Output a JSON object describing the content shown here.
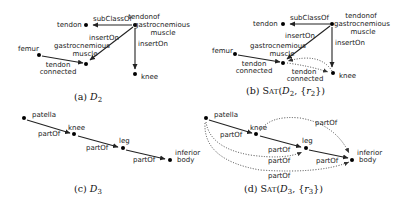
{
  "panels": [
    {
      "id": "a",
      "caption": "(a) D₂",
      "nodes": [
        {
          "id": "tendon",
          "label": "tendon"
        },
        {
          "id": "tog",
          "label": "tendonof gastrocnemious muscle"
        },
        {
          "id": "gm",
          "label": "gastrocnemious muscle"
        },
        {
          "id": "femur",
          "label": "femur"
        },
        {
          "id": "knee",
          "label": "knee"
        }
      ],
      "edges": [
        {
          "from": "tog",
          "to": "tendon",
          "label": "subClassOf",
          "style": "solid"
        },
        {
          "from": "tog",
          "to": "gm",
          "label": "insertOn",
          "style": "solid"
        },
        {
          "from": "tog",
          "to": "knee",
          "label": "insertOn",
          "style": "solid"
        },
        {
          "from": "femur",
          "to": "gm",
          "label": "tendon connected",
          "style": "solid"
        }
      ]
    },
    {
      "id": "b",
      "caption": "(b) SAT(D₂, {r₂})",
      "nodes": [
        {
          "id": "tendon",
          "label": "tendon"
        },
        {
          "id": "tog",
          "label": "tendonof gastrocnemious muscle"
        },
        {
          "id": "gm",
          "label": "gastrocnemious muscle"
        },
        {
          "id": "femur",
          "label": "femur"
        },
        {
          "id": "knee",
          "label": "knee"
        }
      ],
      "edges": [
        {
          "from": "tog",
          "to": "tendon",
          "label": "subClassOf",
          "style": "solid"
        },
        {
          "from": "tog",
          "to": "gm",
          "label": "insertOn",
          "style": "solid"
        },
        {
          "from": "tog",
          "to": "knee",
          "label": "insertOn",
          "style": "solid"
        },
        {
          "from": "femur",
          "to": "gm",
          "label": "tendon connected",
          "style": "solid"
        },
        {
          "from": "gm",
          "to": "knee",
          "label": "tendon connected",
          "style": "dotted"
        },
        {
          "from": "knee",
          "to": "gm",
          "label": "",
          "style": "dotted"
        }
      ]
    },
    {
      "id": "c",
      "caption": "(c) D₃",
      "nodes": [
        {
          "id": "patella",
          "label": "patella"
        },
        {
          "id": "knee",
          "label": "knee"
        },
        {
          "id": "leg",
          "label": "leg"
        },
        {
          "id": "ib",
          "label": "inferior body"
        }
      ],
      "edges": [
        {
          "from": "patella",
          "to": "knee",
          "label": "partOf",
          "style": "solid"
        },
        {
          "from": "knee",
          "to": "leg",
          "label": "partOf",
          "style": "solid"
        },
        {
          "from": "leg",
          "to": "ib",
          "label": "partOf",
          "style": "solid"
        }
      ]
    },
    {
      "id": "d",
      "caption": "(d) SAT(D₃, {r₃})",
      "nodes": [
        {
          "id": "patella",
          "label": "patella"
        },
        {
          "id": "knee",
          "label": "knee"
        },
        {
          "id": "leg",
          "label": "leg"
        },
        {
          "id": "ib",
          "label": "inferior body"
        }
      ],
      "edges": [
        {
          "from": "patella",
          "to": "knee",
          "label": "partOf",
          "style": "solid"
        },
        {
          "from": "knee",
          "to": "leg",
          "label": "partOf",
          "style": "solid"
        },
        {
          "from": "leg",
          "to": "ib",
          "label": "partOf",
          "style": "solid"
        },
        {
          "from": "knee",
          "to": "ib",
          "label": "partOf",
          "style": "dotted"
        },
        {
          "from": "patella",
          "to": "leg",
          "label": "partOf",
          "style": "dotted"
        },
        {
          "from": "patella",
          "to": "ib",
          "label": "partOf",
          "style": "dotted"
        }
      ]
    }
  ],
  "labels": {
    "subClassOf": "subClassOf",
    "insertOn": "insertOn",
    "tendon": "tendon",
    "tendonof": "tendonof",
    "gastrocnemious": "gastrocnemious",
    "muscle": "muscle",
    "femur": "femur",
    "knee": "knee",
    "connected": "connected",
    "patella": "patella",
    "leg": "leg",
    "inferior": "inferior",
    "body": "body",
    "partOf": "partOf"
  },
  "captions": {
    "a_pre": "(a) ",
    "a_math": "D",
    "a_sub": "2",
    "b_pre": "(b) ",
    "b_sat": "Sat",
    "b_args_open": "(",
    "b_D": "D",
    "b_sub": "2",
    "b_mid": ", {",
    "b_r": "r",
    "b_rsub": "2",
    "b_close": "})",
    "c_pre": "(c) ",
    "c_math": "D",
    "c_sub": "3",
    "d_pre": "(d) ",
    "d_sat": "Sat",
    "d_args_open": "(",
    "d_D": "D",
    "d_sub": "3",
    "d_mid": ", {",
    "d_r": "r",
    "d_rsub": "3",
    "d_close": "})"
  }
}
